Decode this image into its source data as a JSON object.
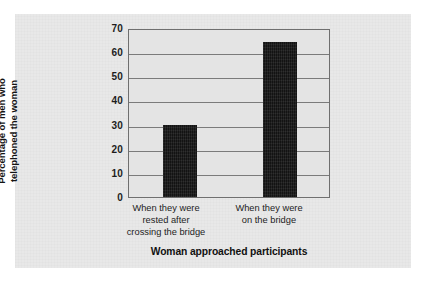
{
  "chart_data": {
    "type": "bar",
    "title": "",
    "xlabel": "Woman approached participants",
    "ylabel": "Percentage of men who\ntelephoned the woman",
    "ylabel_lines": [
      "Percentage of men who",
      "telephoned the woman"
    ],
    "categories": [
      "When they were\nrested after\ncrossing the bridge",
      "When they were\non the bridge"
    ],
    "category_lines": [
      [
        "When they were",
        "rested after",
        "crossing the bridge"
      ],
      [
        "When they were",
        "on the bridge"
      ]
    ],
    "values": [
      30,
      65
    ],
    "ylim": [
      0,
      70
    ],
    "yticks": [
      0,
      10,
      20,
      30,
      40,
      50,
      60,
      70
    ],
    "ytick_labels": [
      "0",
      "10",
      "20",
      "30",
      "40",
      "50",
      "60",
      "70"
    ],
    "grid": true,
    "grid_axis": "y",
    "legend": false,
    "legend_position": "none",
    "colors": {
      "bar": "#1b1b1b",
      "gridline": "#7b7b7b",
      "plot_background": "#e4e4e4",
      "panel_background": "#e8e8e8",
      "axis_frame": "#6f6f6f",
      "text": "#1d1d1d"
    }
  }
}
